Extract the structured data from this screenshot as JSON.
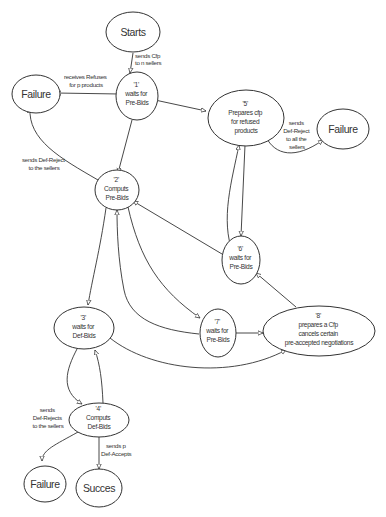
{
  "diagram": {
    "type": "state-diagram",
    "nodes": {
      "starts": {
        "label": "Starts"
      },
      "s1": {
        "id": "'1'",
        "line1": "waits for",
        "line2": "Pre-Bids"
      },
      "failure_top": {
        "label": "Failure"
      },
      "s5": {
        "id": "'5'",
        "line1": "Prepares cfp",
        "line2": "for refused",
        "line3": "products"
      },
      "failure_right": {
        "label": "Failure"
      },
      "s2": {
        "id": "'2'",
        "line1": "Computs",
        "line2": "Pre-Bids"
      },
      "s6": {
        "id": "'6'",
        "line1": "waits for",
        "line2": "Pre-Bids"
      },
      "s3": {
        "id": "'3'",
        "line1": "waits for",
        "line2": "Def-Bids"
      },
      "s7": {
        "id": "'7'",
        "line1": "waits for",
        "line2": "Pre-Bids"
      },
      "s8": {
        "id": "'8'",
        "line1": "prepares a Cfp",
        "line2": "cancels certain",
        "line3": "pre-accepted negotiations"
      },
      "s4": {
        "id": "'4'",
        "line1": "Computs",
        "line2": "Def-Bids"
      },
      "failure_bottom": {
        "label": "Failure"
      },
      "succes": {
        "label": "Succes"
      }
    },
    "edges": {
      "start_to_1": [
        "sends Cfp",
        "to n sellers"
      ],
      "s1_to_failure": [
        "receives Refuses",
        "for p products"
      ],
      "s1_to_s5": [
        "receives Pre-Bids",
        "for q (<p) products",
        "and(p-q) Refuses"
      ],
      "s1_to_s2": [
        "receives",
        "Pre-Bids for p products"
      ],
      "s2_to_failure": [
        "sends Def-Reject",
        "to the sellers"
      ],
      "s5_to_failure": [
        "sends",
        "Def-Reject",
        "to all the",
        "sellers"
      ],
      "s6_to_s5": [
        "receives Refuses",
        "for unavailable products"
      ],
      "s5_to_s6": [
        "sends (p-q) Cfp for",
        "unavailable products"
      ],
      "s6_to_s2": [
        "receives Pre-Bids",
        "for (q-p) unavailable products"
      ],
      "s2_to_s3": [
        "sends p",
        "GlobalPre-accept",
        "and Pre-reject",
        "to the others"
      ],
      "s2_to_s7": [
        "sends q(<p)",
        "Pre-accept",
        "and All-Rejects",
        "for the others"
      ],
      "s7_to_s2": [
        "receives des",
        "Pre-Bids",
        "for the (q-p)",
        "unavailable products"
      ],
      "s7_to_s8": [
        "receives Refuses",
        "for unavailable",
        "products"
      ],
      "s8_to_s6": [
        "sends Cfp for unavailable products",
        "and possibly",
        "Reject_and_new cfp"
      ],
      "s3_to_s8": [
        "a Pre-accepted seller abandons"
      ],
      "s3_to_s4": [
        "receives p",
        "Global Def-Bids",
        "and Pre-Bids"
      ],
      "s4_to_s3": [
        "sends at least a",
        "Pre-Reject to a",
        "Pre-accepted seller and",
        "a pre-Accept to another seller"
      ],
      "s4_to_failure": [
        "sends",
        "Def-Rejects",
        "to the sellers"
      ],
      "s4_to_succes": [
        "sends p",
        "Def-Accepts"
      ]
    }
  }
}
